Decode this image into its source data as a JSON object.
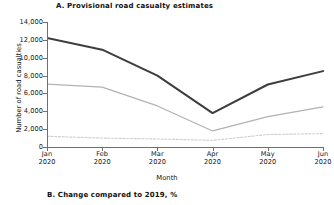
{
  "panel_a": {
    "title": "A. Provisional road casualty estimates"
  },
  "panel_b": {
    "title": "B. Change compared to 2019, %"
  },
  "chart_data": {
    "type": "line",
    "title": "A. Provisional road casualty estimates",
    "xlabel": "Month",
    "ylabel": "Number of road casualties",
    "categories": [
      "Jan\n2020",
      "Feb\n2020",
      "Mar\n2020",
      "Apr\n2020",
      "May\n2020",
      "Jun\n2020"
    ],
    "x_tick_labels": [
      {
        "month": "Jan",
        "year": "2020"
      },
      {
        "month": "Feb",
        "year": "2020"
      },
      {
        "month": "Mar",
        "year": "2020"
      },
      {
        "month": "Apr",
        "year": "2020"
      },
      {
        "month": "May",
        "year": "2020"
      },
      {
        "month": "Jun",
        "year": "2020"
      }
    ],
    "y_tick_labels": [
      "14,000",
      "12,000",
      "10,000",
      "8,000",
      "6,000",
      "4,000",
      "2,000",
      "0"
    ],
    "y_tick_values": [
      14000,
      12000,
      10000,
      8000,
      6000,
      4000,
      2000,
      0
    ],
    "ylim": [
      0,
      14000
    ],
    "grid": false,
    "legend": "none",
    "series": [
      {
        "name": "series-dark",
        "style": "solid",
        "color": "#3d3d3d",
        "width": 2.0,
        "values": [
          12200,
          10900,
          8000,
          3800,
          7000,
          8500
        ]
      },
      {
        "name": "series-mid",
        "style": "solid",
        "color": "#b2b2b2",
        "width": 1.2,
        "values": [
          7050,
          6700,
          4600,
          1800,
          3400,
          4500
        ]
      },
      {
        "name": "series-light-dashed",
        "style": "dashed",
        "color": "#cfcfcf",
        "width": 1.1,
        "values": [
          1200,
          1000,
          900,
          750,
          1400,
          1500
        ]
      }
    ]
  }
}
